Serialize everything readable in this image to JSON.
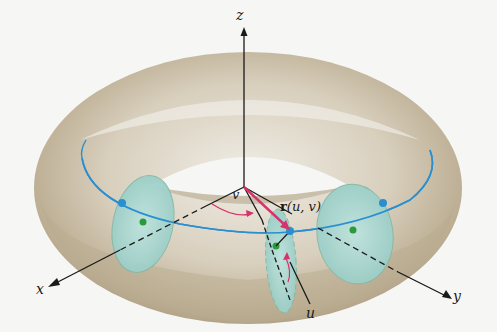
{
  "figure": {
    "axes": {
      "x": {
        "label": "x"
      },
      "y": {
        "label": "y"
      },
      "z": {
        "label": "z"
      }
    },
    "labels": {
      "angle_v": "v",
      "angle_u": "u",
      "position_vector": "r(u, v)",
      "position_vector_bold": "r",
      "position_vector_args": "(u, v)"
    },
    "colors": {
      "torus_fill": "#c9bda6",
      "torus_highlight": "#e9e5dc",
      "cross_section_fill": "#a9d8d2",
      "center_circle": "#2a8fcf",
      "vector": "#d6336c",
      "center_point": "#2a9a3a",
      "axis": "#1a1a1a",
      "background": "#f6f6f4"
    }
  }
}
